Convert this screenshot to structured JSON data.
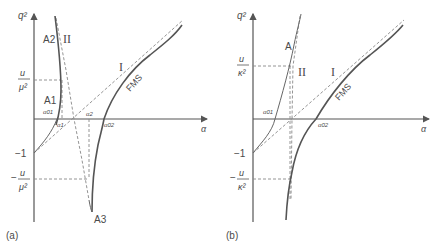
{
  "panels": [
    {
      "id": "a",
      "caption": "(a)",
      "y_axis_label": "q²",
      "x_axis_label": "α",
      "y_ticks": {
        "upper": {
          "num": "u",
          "den": "μ²"
        },
        "minus_one": "−1",
        "lower": {
          "sign": "−",
          "num": "u",
          "den": "μ²"
        }
      },
      "x_points": [
        "α01",
        "α1",
        "α2",
        "α02"
      ],
      "curve_labels": {
        "A1": "A1",
        "A2": "A2",
        "A3": "A3",
        "II": "II",
        "I": "I",
        "FMS": "FMS"
      }
    },
    {
      "id": "b",
      "caption": "(b)",
      "y_axis_label": "q²",
      "x_axis_label": "α",
      "y_ticks": {
        "upper": {
          "num": "u",
          "den": "κ²"
        },
        "minus_one": "−1",
        "lower": {
          "sign": "−",
          "num": "u",
          "den": "κ²"
        }
      },
      "x_points": [
        "α01",
        "α02"
      ],
      "curve_labels": {
        "A": "A",
        "II": "II",
        "I": "I",
        "FMS": "FMS"
      }
    }
  ]
}
